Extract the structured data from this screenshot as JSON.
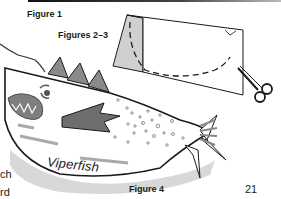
{
  "page": {
    "number": "21",
    "side_text": [
      "ch",
      "rd"
    ]
  },
  "figures": {
    "figure1_label": "Figure 1",
    "figure23_label": "Figures 2–3",
    "figure4_label": "Figure 4",
    "fish_name": "Viperfish"
  },
  "icons": {
    "scissors": "scissors-icon",
    "arrow": "left-arrow-icon"
  },
  "colors": {
    "line": "#1a1a1a",
    "gray_fill": "#7a7a7a",
    "light_gray": "#c8c8c8",
    "fin_gray": "#8c8c8c"
  }
}
